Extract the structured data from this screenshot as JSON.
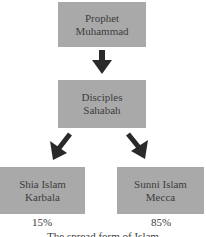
{
  "diagram": {
    "nodes": {
      "top": {
        "line1": "Prophet",
        "line2": "Muhammad"
      },
      "middle": {
        "line1": "Disciples",
        "line2": "Sahabah"
      },
      "left": {
        "line1": "Shia Islam",
        "line2": "Karbala",
        "percent": "15%"
      },
      "right": {
        "line1": "Sunni Islam",
        "line2": "Mecca",
        "percent": "85%"
      }
    },
    "edges": [
      {
        "from": "top",
        "to": "middle"
      },
      {
        "from": "middle",
        "to": "left"
      },
      {
        "from": "middle",
        "to": "right"
      }
    ],
    "caption": "The spread form of Islam",
    "colors": {
      "box_fill": "#a9a9a9",
      "arrow": "#2a2a2a",
      "text": "#3d3d3d"
    }
  }
}
